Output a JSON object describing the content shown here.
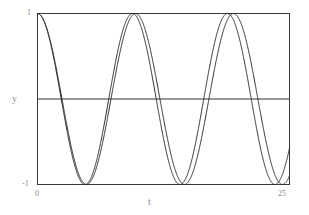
{
  "chart_data": {
    "type": "line",
    "title": "",
    "xlabel": "t",
    "ylabel": "y",
    "xlim": [
      0,
      25
    ],
    "ylim": [
      -1,
      1
    ],
    "grid": false,
    "legend": null,
    "xticks": [
      0,
      25
    ],
    "xticklabels": [
      "0",
      "25"
    ],
    "yticks": [
      -1,
      1
    ],
    "yticklabels": [
      "-1",
      "1"
    ],
    "zero_line": {
      "y": 0,
      "visible": true,
      "color": "#333333"
    },
    "line_color": "#2b2b2b",
    "line_width": 1,
    "frame_color": "#3a3a3a",
    "background": "#ffffff",
    "annotations": [],
    "series": [
      {
        "name": "cos(2*pi*f1*t)",
        "frequency": 0.1029,
        "amplitude": 1,
        "phase": 0,
        "color": "#2b2b2b",
        "x": [
          0,
          0.5,
          1,
          1.5,
          2,
          2.5,
          3,
          3.5,
          4,
          4.5,
          5,
          5.5,
          6,
          6.5,
          7,
          7.5,
          8,
          8.5,
          9,
          9.5,
          10,
          10.5,
          11,
          11.5,
          12,
          12.5,
          13,
          13.5,
          14,
          14.5,
          15,
          15.5,
          16,
          16.5,
          17,
          17.5,
          18,
          18.5,
          19,
          19.5,
          20,
          20.5,
          21,
          21.5,
          22,
          22.5,
          23,
          23.5,
          24,
          24.5,
          25
        ],
        "y": [
          1.0,
          0.948,
          0.798,
          0.567,
          0.28,
          -0.032,
          -0.335,
          -0.598,
          -0.8,
          -0.921,
          -0.955,
          -0.898,
          -0.759,
          -0.55,
          -0.29,
          -0.005,
          0.28,
          0.535,
          0.739,
          0.875,
          0.932,
          0.908,
          0.803,
          0.629,
          0.4,
          0.135,
          -0.14,
          -0.4,
          -0.62,
          -0.786,
          -0.885,
          -0.912,
          -0.865,
          -0.75,
          -0.575,
          -0.355,
          -0.105,
          0.152,
          0.395,
          0.6,
          0.76,
          0.862,
          0.9,
          0.872,
          0.782,
          0.635,
          0.44,
          0.215,
          -0.025,
          -0.26,
          -0.47
        ]
      },
      {
        "name": "cos(2*pi*f2*t)",
        "frequency": 0.1061,
        "amplitude": 1,
        "phase": 0,
        "color": "#2b2b2b",
        "x": [
          0,
          0.5,
          1,
          1.5,
          2,
          2.5,
          3,
          3.5,
          4,
          4.5,
          5,
          5.5,
          6,
          6.5,
          7,
          7.5,
          8,
          8.5,
          9,
          9.5,
          10,
          10.5,
          11,
          11.5,
          12,
          12.5,
          13,
          13.5,
          14,
          14.5,
          15,
          15.5,
          16,
          16.5,
          17,
          17.5,
          18,
          18.5,
          19,
          19.5,
          20,
          20.5,
          21,
          21.5,
          22,
          22.5,
          23,
          23.5,
          24,
          24.5,
          25
        ],
        "y": [
          1.0,
          0.944,
          0.783,
          0.535,
          0.232,
          -0.09,
          -0.395,
          -0.652,
          -0.84,
          -0.948,
          -0.968,
          -0.9,
          -0.75,
          -0.53,
          -0.262,
          0.03,
          0.315,
          0.575,
          0.778,
          0.908,
          0.955,
          0.915,
          0.795,
          0.605,
          0.36,
          0.09,
          -0.19,
          -0.45,
          -0.67,
          -0.83,
          -0.92,
          -0.935,
          -0.872,
          -0.74,
          -0.55,
          -0.315,
          -0.055,
          0.205,
          0.45,
          0.66,
          0.81,
          0.9,
          0.92,
          0.868,
          0.755,
          0.585,
          0.37,
          0.13,
          -0.12,
          -0.36,
          -0.57
        ]
      }
    ]
  },
  "axis": {
    "x_label": "t",
    "y_label": "y",
    "x_tick_min": "0",
    "x_tick_max": "25",
    "y_tick_min": "-1",
    "y_tick_max": "1"
  }
}
